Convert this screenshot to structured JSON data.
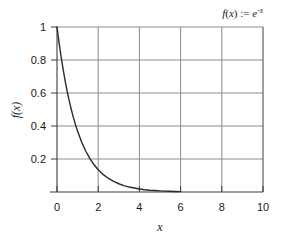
{
  "chart_data": {
    "type": "line",
    "title": "",
    "subtitle": "",
    "xlabel": "x",
    "ylabel": "f(x)",
    "xlim": [
      0,
      10
    ],
    "ylim": [
      0,
      1
    ],
    "grid": true,
    "legend_position": "none",
    "xticks": [
      0,
      2,
      4,
      6,
      8,
      10
    ],
    "xtick_labels": [
      "0",
      "2",
      "4",
      "6",
      "8",
      "10"
    ],
    "yticks": [
      0,
      0.2,
      0.4,
      0.6,
      0.8,
      1
    ],
    "ytick_labels": [
      "",
      "0.2",
      "0.4",
      "0.6",
      "0.8",
      "1"
    ],
    "annotations": [
      {
        "name": "function-definition",
        "text": "f(x) := e^-x",
        "position": "top-right",
        "parts": {
          "f": "f",
          "paren_open": "(",
          "var": "x",
          "paren_close": ")",
          "assign": " := ",
          "base": "e",
          "exponent": "-x"
        }
      }
    ],
    "series": [
      {
        "name": "f(x) = e^-x",
        "color": "#2b2b2b",
        "x": [
          0,
          0.1,
          0.2,
          0.3,
          0.4,
          0.5,
          0.6,
          0.7,
          0.8,
          0.9,
          1.0,
          1.2,
          1.4,
          1.6,
          1.8,
          2.0,
          2.25,
          2.5,
          2.75,
          3.0,
          3.25,
          3.5,
          3.75,
          4.0,
          4.25,
          4.5,
          4.75,
          5.0,
          5.25,
          5.5,
          5.75,
          6.0
        ],
        "y": [
          1.0,
          0.905,
          0.819,
          0.741,
          0.67,
          0.607,
          0.549,
          0.497,
          0.449,
          0.407,
          0.368,
          0.301,
          0.247,
          0.202,
          0.165,
          0.135,
          0.105,
          0.082,
          0.064,
          0.05,
          0.039,
          0.03,
          0.024,
          0.018,
          0.014,
          0.011,
          0.0087,
          0.0067,
          0.0052,
          0.0041,
          0.0032,
          0.0025
        ]
      }
    ],
    "colors": {
      "curve": "#2b2b2b",
      "axis": "#3d3d3d",
      "grid": "#8c8c8c",
      "text": "#1a1a1a",
      "background": "#ffffff"
    }
  },
  "axes": {
    "x_axis_label": "x",
    "y_axis_label": "f(x)"
  }
}
